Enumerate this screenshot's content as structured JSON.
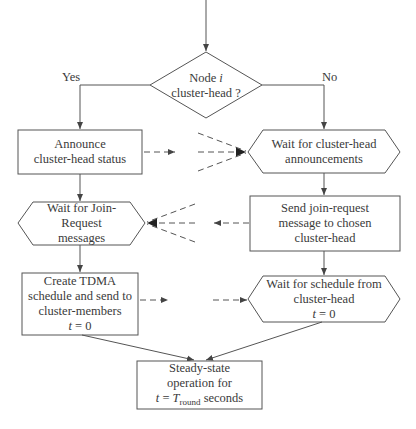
{
  "diagram": {
    "type": "flowchart",
    "title": "",
    "decision": {
      "line1": "Node",
      "var": "i",
      "line2": "cluster-head ?"
    },
    "branches": {
      "yes_label": "Yes",
      "no_label": "No"
    },
    "nodes": {
      "announce": {
        "lines": [
          "Announce",
          "cluster-head status"
        ]
      },
      "wait_announcements": {
        "lines": [
          "Wait for cluster-head",
          "announcements"
        ]
      },
      "wait_join": {
        "lines": [
          "Wait for Join-",
          "Request",
          "messages"
        ]
      },
      "send_join": {
        "lines": [
          "Send join-request",
          "message to chosen",
          "cluster-head"
        ]
      },
      "create_tdma": {
        "lines": [
          "Create TDMA",
          "schedule and send to",
          "cluster-members"
        ],
        "time_var": "t",
        "time_eq": " = 0"
      },
      "wait_schedule": {
        "lines": [
          "Wait for schedule from",
          "cluster-head"
        ],
        "time_var": "t",
        "time_eq": " = 0"
      },
      "steady_state": {
        "lines": [
          "Steady-state",
          "operation for"
        ],
        "time_var": "t",
        "time_eq": " = ",
        "T": "T",
        "T_sub": "round",
        "suffix": " seconds"
      }
    },
    "edges": [
      {
        "from": "start",
        "to": "decision",
        "style": "solid"
      },
      {
        "from": "decision",
        "to": "announce",
        "label": "Yes",
        "style": "solid"
      },
      {
        "from": "decision",
        "to": "wait_announcements",
        "label": "No",
        "style": "solid"
      },
      {
        "from": "announce",
        "to": "wait_announcements",
        "style": "dashed",
        "note": "broadcast from multiple cluster-heads"
      },
      {
        "from": "announce",
        "to": "wait_join",
        "style": "solid"
      },
      {
        "from": "wait_announcements",
        "to": "send_join",
        "style": "solid"
      },
      {
        "from": "send_join",
        "to": "wait_join",
        "style": "dashed",
        "note": "from multiple members"
      },
      {
        "from": "wait_join",
        "to": "create_tdma",
        "style": "solid"
      },
      {
        "from": "send_join",
        "to": "wait_schedule",
        "style": "solid"
      },
      {
        "from": "create_tdma",
        "to": "wait_schedule",
        "style": "dashed"
      },
      {
        "from": "create_tdma",
        "to": "steady_state",
        "style": "solid"
      },
      {
        "from": "wait_schedule",
        "to": "steady_state",
        "style": "solid"
      }
    ],
    "colors": {
      "stroke": "#555555",
      "text": "#3a3a3a",
      "background": "#ffffff"
    }
  }
}
